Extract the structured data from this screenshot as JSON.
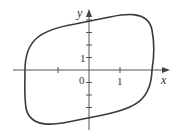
{
  "diagram": {
    "type": "closed-curve-phase-portrait",
    "axes": {
      "x_label": "x",
      "y_label": "y",
      "origin_label": "0",
      "x_tick_label": "1",
      "y_tick_label": "1"
    },
    "colors": {
      "curve": "#3a3a3a",
      "axes": "#555555",
      "background": "#ffffff"
    }
  }
}
